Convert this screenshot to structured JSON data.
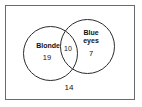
{
  "diagram": {
    "type": "venn-two-set",
    "universe": {
      "name": "universal-set-rectangle",
      "outside_count": "14"
    },
    "sets": [
      {
        "id": "blonde",
        "label": "Blonde",
        "count": "19",
        "position": "left"
      },
      {
        "id": "blue-eyes",
        "label": "Blue\neyes",
        "count": "7",
        "position": "right"
      }
    ],
    "intersection": {
      "label": "",
      "count": "10"
    },
    "colors": {
      "background": "#ffffff",
      "circle_stroke": "#2b2b2b",
      "box_stroke": "#6b6b6b",
      "text": "#111111"
    }
  },
  "chart_data": {
    "type": "venn",
    "title": "",
    "categories": [
      "Blonde only",
      "Both",
      "Blue eyes only",
      "Neither"
    ],
    "values": [
      19,
      10,
      7,
      14
    ],
    "set_labels": [
      "Blonde",
      "Blue eyes"
    ],
    "outside_label": "14"
  }
}
